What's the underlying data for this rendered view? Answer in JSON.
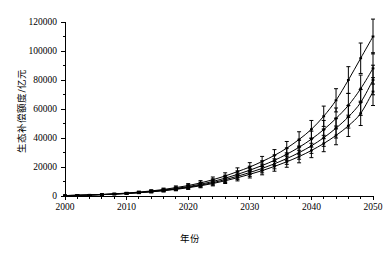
{
  "chart_data": {
    "type": "line",
    "title": "",
    "subtitle": "",
    "xlabel": "年份",
    "ylabel": "生态补偿额度/亿元",
    "xlim": [
      2000,
      2050
    ],
    "ylim": [
      0,
      120000
    ],
    "grid": false,
    "legend": "none",
    "line_color": "#000000",
    "background_color": "#ffffff",
    "error_bars": true,
    "marker": "vertical-tick",
    "x_major_ticks": [
      2000,
      2010,
      2020,
      2030,
      2040,
      2050
    ],
    "x_tick_labels": [
      "2000",
      "2010",
      "2020",
      "2030",
      "2040",
      "2050"
    ],
    "x_minor_tick_step": 2,
    "y_major_ticks": [
      0,
      20000,
      40000,
      60000,
      80000,
      100000,
      120000
    ],
    "y_tick_labels": [
      "0",
      "20000",
      "40000",
      "60000",
      "80000",
      "100000",
      "120000"
    ],
    "y_minor_tick_step": 10000,
    "x": [
      2000,
      2002,
      2004,
      2006,
      2008,
      2010,
      2012,
      2014,
      2016,
      2018,
      2020,
      2022,
      2024,
      2026,
      2028,
      2030,
      2032,
      2034,
      2036,
      2038,
      2040,
      2042,
      2044,
      2046,
      2048,
      2050
    ],
    "series": [
      {
        "name": "情景1",
        "values": [
          300,
          500,
          750,
          1100,
          1500,
          2000,
          2700,
          3500,
          4500,
          5800,
          7200,
          9000,
          11200,
          13800,
          16800,
          20000,
          23800,
          28000,
          33000,
          39000,
          46000,
          55000,
          66000,
          80000,
          95000,
          110000
        ],
        "error": [
          200,
          250,
          300,
          380,
          450,
          550,
          680,
          800,
          950,
          1150,
          1350,
          1600,
          1900,
          2200,
          2600,
          3000,
          3500,
          4000,
          4600,
          5300,
          6100,
          7000,
          8000,
          9200,
          10500,
          12000
        ]
      },
      {
        "name": "情景2",
        "values": [
          300,
          480,
          700,
          1000,
          1380,
          1850,
          2450,
          3200,
          4100,
          5200,
          6500,
          8100,
          10000,
          12300,
          14900,
          17800,
          21000,
          24600,
          28800,
          33600,
          39200,
          45800,
          53500,
          62500,
          74000,
          88000
        ],
        "error": [
          200,
          240,
          290,
          360,
          430,
          520,
          640,
          760,
          900,
          1080,
          1280,
          1500,
          1780,
          2060,
          2400,
          2780,
          3200,
          3650,
          4200,
          4800,
          5500,
          6300,
          7200,
          8200,
          9400,
          10800
        ]
      },
      {
        "name": "情景3",
        "values": [
          300,
          470,
          680,
          960,
          1320,
          1760,
          2320,
          3000,
          3820,
          4840,
          6050,
          7500,
          9200,
          11300,
          13600,
          16200,
          19000,
          22200,
          25800,
          29900,
          34600,
          40200,
          46800,
          54600,
          64500,
          80000
        ],
        "error": [
          200,
          230,
          280,
          350,
          410,
          500,
          610,
          730,
          860,
          1030,
          1220,
          1430,
          1690,
          1960,
          2280,
          2640,
          3030,
          3460,
          3970,
          4540,
          5200,
          5950,
          6800,
          7750,
          8900,
          10200
        ]
      },
      {
        "name": "情景4",
        "values": [
          300,
          460,
          660,
          930,
          1270,
          1690,
          2220,
          2860,
          3630,
          4580,
          5700,
          7050,
          8600,
          10500,
          12600,
          14950,
          17500,
          20400,
          23600,
          27200,
          31400,
          36200,
          41800,
          48400,
          57000,
          72000
        ],
        "error": [
          200,
          225,
          270,
          340,
          400,
          480,
          590,
          700,
          830,
          990,
          1170,
          1370,
          1620,
          1880,
          2180,
          2520,
          2890,
          3300,
          3780,
          4320,
          4950,
          5650,
          6450,
          7350,
          8400,
          9600
        ]
      }
    ]
  }
}
